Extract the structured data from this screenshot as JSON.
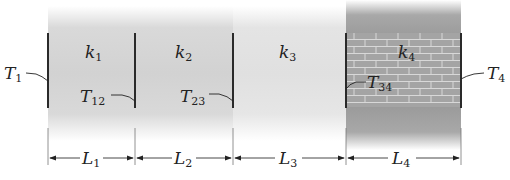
{
  "diagram": {
    "type": "composite-wall-heat-conduction",
    "layers": [
      {
        "conductivity": "k",
        "conductivity_sub": "1",
        "length": "L",
        "length_sub": "1",
        "material": "gray"
      },
      {
        "conductivity": "k",
        "conductivity_sub": "2",
        "length": "L",
        "length_sub": "2",
        "material": "gray"
      },
      {
        "conductivity": "k",
        "conductivity_sub": "3",
        "length": "L",
        "length_sub": "3",
        "material": "light-gray"
      },
      {
        "conductivity": "k",
        "conductivity_sub": "4",
        "length": "L",
        "length_sub": "4",
        "material": "brick"
      }
    ],
    "temperatures": [
      {
        "symbol": "T",
        "sub": "1"
      },
      {
        "symbol": "T",
        "sub": "12"
      },
      {
        "symbol": "T",
        "sub": "23"
      },
      {
        "symbol": "T",
        "sub": "34"
      },
      {
        "symbol": "T",
        "sub": "4"
      }
    ],
    "colors": {
      "line": "#333333",
      "layer_gray": "#d2d2d2",
      "layer_light": "#e2e2e2",
      "brick": "#9c9c9c",
      "mortar": "#d8d8d8"
    }
  }
}
